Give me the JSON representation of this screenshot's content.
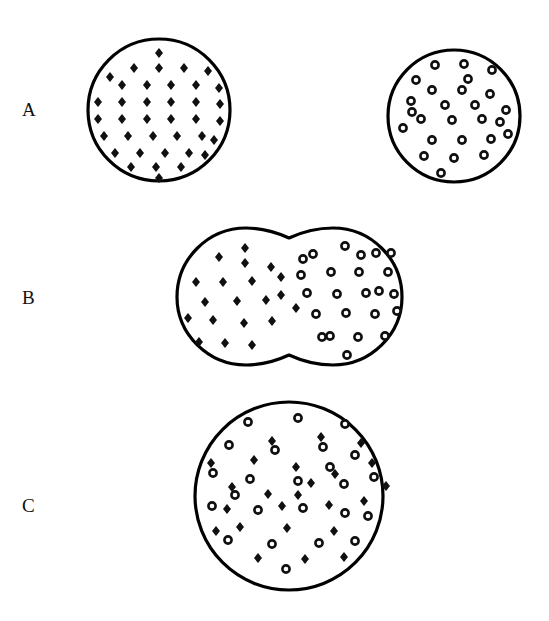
{
  "figure": {
    "background_color": "#ffffff",
    "ink_color": "#000000",
    "width": 549,
    "height": 621
  },
  "markers": {
    "diamond": {
      "name": "filled-diamond-marker",
      "legend_meaning": "membrane protein type 1",
      "fill": "#101010",
      "size": 9
    },
    "ring": {
      "name": "open-ring-marker",
      "legend_meaning": "membrane protein type 2",
      "fill": "#ffffff",
      "stroke": "#101010",
      "size": 8.4,
      "stroke_width": 2.6
    }
  },
  "rows": [
    {
      "label": "A",
      "label_x": 28,
      "label_y": 100,
      "description": "two separate cells before fusion",
      "shapes": [
        {
          "name": "cell-diamond-labeled",
          "type": "circle",
          "cx": 159,
          "cy": 110,
          "r": 71,
          "marker": "diamond",
          "marker_count": 39
        },
        {
          "name": "cell-ring-labeled",
          "type": "circle",
          "cx": 454,
          "cy": 116,
          "r": 66,
          "marker": "ring",
          "marker_count": 26
        }
      ]
    },
    {
      "label": "B",
      "label_x": 28,
      "label_y": 288,
      "description": "cells fused, proteins not yet intermixed",
      "shapes": [
        {
          "name": "fused-cell-left-lobe",
          "type": "fused-lobe",
          "cx": 233,
          "cy": 296,
          "r": 68,
          "marker": "diamond",
          "marker_count": 20
        },
        {
          "name": "fused-cell-right-lobe",
          "type": "fused-lobe",
          "cx": 344,
          "cy": 296,
          "r": 68,
          "marker": "ring",
          "marker_count": 24
        }
      ],
      "neck_x": 289
    },
    {
      "label": "C",
      "label_x": 28,
      "label_y": 496,
      "description": "single cell with proteins fully intermixed",
      "shapes": [
        {
          "name": "mixed-cell",
          "type": "circle",
          "cx": 289,
          "cy": 496,
          "r": 94,
          "marker": "mixed",
          "marker_count": 48
        }
      ]
    }
  ]
}
